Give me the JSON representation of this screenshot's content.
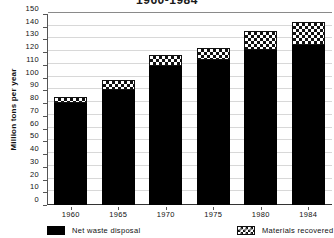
{
  "chart_data": {
    "type": "bar",
    "stacked": true,
    "title": "1960-1984",
    "xlabel": "",
    "ylabel": "Million tons per year",
    "categories": [
      "1960",
      "1965",
      "1970",
      "1975",
      "1980",
      "1984"
    ],
    "ylim": [
      0,
      150
    ],
    "yticks": [
      0,
      10,
      20,
      30,
      40,
      50,
      60,
      70,
      80,
      90,
      100,
      110,
      120,
      130,
      140,
      150
    ],
    "ytick_labels": [
      "0",
      "10",
      "20",
      "30",
      "40",
      "50",
      "60",
      "70",
      "80",
      "90",
      "100",
      "110",
      "120",
      "130",
      "140",
      "150"
    ],
    "grid": true,
    "legend_position": "bottom",
    "series": [
      {
        "name": "Net waste disposal",
        "pattern": "solid-black",
        "color": "#000000",
        "values": [
          80,
          90,
          109,
          114,
          122,
          126
        ]
      },
      {
        "name": "Materials recovered",
        "pattern": "checkerboard",
        "color": "#ffffff",
        "values": [
          5,
          8,
          9,
          9,
          15,
          18
        ]
      }
    ],
    "totals": [
      85,
      98,
      118,
      123,
      137,
      144
    ]
  },
  "legend": {
    "items": [
      {
        "label": "Net waste disposal",
        "swatch": "solid"
      },
      {
        "label": "Materials recovered",
        "swatch": "checker"
      }
    ]
  }
}
